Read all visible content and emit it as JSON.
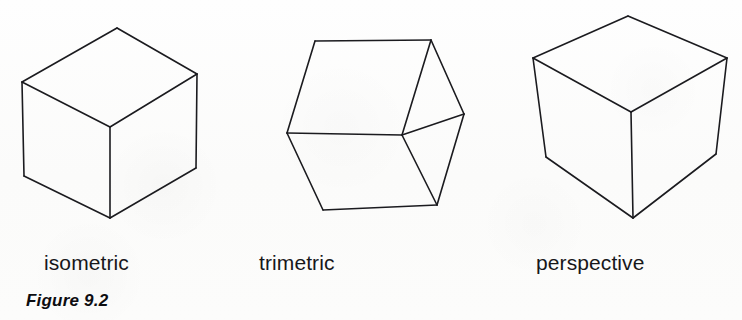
{
  "figure": {
    "caption": "Figure 9.2",
    "background_color": "#fdfdfc",
    "stroke_color": "#1b1b1f",
    "canvas": {
      "width": 742,
      "height": 320
    }
  },
  "labels": {
    "isometric": "isometric",
    "trimetric": "trimetric",
    "perspective": "perspective"
  },
  "cubes": [
    {
      "name": "isometric",
      "label": "isometric",
      "stroke_width": 1.6,
      "vertices": {
        "top": [
          117,
          28
        ],
        "upper_left": [
          22,
          82
        ],
        "upper_right": [
          197,
          74
        ],
        "center": [
          110,
          127
        ],
        "lower_left": [
          24,
          176
        ],
        "lower_right": [
          196,
          168
        ],
        "bottom": [
          110,
          218
        ]
      },
      "edges": [
        [
          "top",
          "upper_left"
        ],
        [
          "top",
          "upper_right"
        ],
        [
          "upper_left",
          "center"
        ],
        [
          "upper_right",
          "center"
        ],
        [
          "upper_left",
          "lower_left"
        ],
        [
          "upper_right",
          "lower_right"
        ],
        [
          "center",
          "bottom"
        ],
        [
          "lower_left",
          "bottom"
        ],
        [
          "lower_right",
          "bottom"
        ]
      ]
    },
    {
      "name": "trimetric",
      "label": "trimetric",
      "stroke_width": 1.6,
      "vertices": {
        "top_left": [
          315,
          41
        ],
        "top_right": [
          431,
          40
        ],
        "right": [
          464,
          114
        ],
        "center": [
          402,
          135
        ],
        "left": [
          287,
          133
        ],
        "bottom_left": [
          323,
          210
        ],
        "bottom_right": [
          437,
          205
        ]
      },
      "edges": [
        [
          "top_left",
          "top_right"
        ],
        [
          "top_left",
          "left"
        ],
        [
          "top_right",
          "center"
        ],
        [
          "top_right",
          "right"
        ],
        [
          "right",
          "center"
        ],
        [
          "right",
          "bottom_right"
        ],
        [
          "left",
          "center"
        ],
        [
          "left",
          "bottom_left"
        ],
        [
          "center",
          "bottom_right"
        ],
        [
          "bottom_left",
          "bottom_right"
        ]
      ]
    },
    {
      "name": "perspective",
      "label": "perspective",
      "stroke_width": 1.6,
      "vertices": {
        "top": [
          628,
          16
        ],
        "upper_left": [
          533,
          58
        ],
        "upper_right": [
          727,
          58
        ],
        "center": [
          631,
          112
        ],
        "lower_left": [
          546,
          157
        ],
        "lower_right": [
          716,
          154
        ],
        "bottom": [
          633,
          218
        ]
      },
      "edges": [
        [
          "top",
          "upper_left"
        ],
        [
          "top",
          "upper_right"
        ],
        [
          "upper_left",
          "center"
        ],
        [
          "upper_right",
          "center"
        ],
        [
          "upper_left",
          "lower_left"
        ],
        [
          "upper_right",
          "lower_right"
        ],
        [
          "center",
          "bottom"
        ],
        [
          "lower_left",
          "bottom"
        ],
        [
          "lower_right",
          "bottom"
        ]
      ]
    }
  ]
}
